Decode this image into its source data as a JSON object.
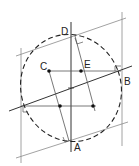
{
  "diagram": {
    "colors": {
      "line": "#555555",
      "thin": "#8a8a8a",
      "dash": "#222222",
      "dot": "#111111"
    },
    "labels": {
      "A": "A",
      "B": "B",
      "C": "C",
      "D": "D",
      "E": "E"
    },
    "points": {
      "A": [
        72,
        141
      ],
      "B": [
        121,
        70
      ],
      "C": [
        49,
        71
      ],
      "D": [
        72,
        36
      ],
      "E": [
        81,
        71
      ],
      "center": [
        71,
        88
      ],
      "left": [
        21,
        107
      ],
      "lower_left_dot": [
        60,
        106
      ],
      "lower_right_dot": [
        93,
        106
      ]
    }
  }
}
